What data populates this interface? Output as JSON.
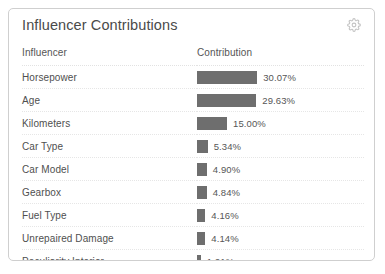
{
  "card": {
    "title": "Influencer Contributions",
    "gear_icon": "gear-icon"
  },
  "table": {
    "headers": {
      "influencer": "Influencer",
      "contribution": "Contribution"
    },
    "rows": [
      {
        "influencer": "Horsepower",
        "contribution_label": "30.07%",
        "contribution_value": 30.07
      },
      {
        "influencer": "Age",
        "contribution_label": "29.63%",
        "contribution_value": 29.63
      },
      {
        "influencer": "Kilometers",
        "contribution_label": "15.00%",
        "contribution_value": 15.0
      },
      {
        "influencer": "Car Type",
        "contribution_label": "5.34%",
        "contribution_value": 5.34
      },
      {
        "influencer": "Car Model",
        "contribution_label": "4.90%",
        "contribution_value": 4.9
      },
      {
        "influencer": "Gearbox",
        "contribution_label": "4.84%",
        "contribution_value": 4.84
      },
      {
        "influencer": "Fuel Type",
        "contribution_label": "4.16%",
        "contribution_value": 4.16
      },
      {
        "influencer": "Unrepaired Damage",
        "contribution_label": "4.14%",
        "contribution_value": 4.14
      },
      {
        "influencer": "Peculiarity Interior",
        "contribution_label": "1.91%",
        "contribution_value": 1.91
      }
    ]
  },
  "chart_data": {
    "type": "bar",
    "title": "Influencer Contributions",
    "xlabel": "Contribution",
    "ylabel": "Influencer",
    "categories": [
      "Horsepower",
      "Age",
      "Kilometers",
      "Car Type",
      "Car Model",
      "Gearbox",
      "Fuel Type",
      "Unrepaired Damage",
      "Peculiarity Interior"
    ],
    "values": [
      30.07,
      29.63,
      15.0,
      5.34,
      4.9,
      4.84,
      4.16,
      4.14,
      1.91
    ],
    "value_labels": [
      "30.07%",
      "29.63%",
      "15.00%",
      "5.34%",
      "4.90%",
      "4.84%",
      "4.16%",
      "4.14%",
      "1.91%"
    ],
    "xlim": [
      0,
      30.07
    ],
    "grid": false,
    "legend": false,
    "orientation": "horizontal",
    "bar_color": "#6e6e6e"
  },
  "style": {
    "bar_color": "#6e6e6e",
    "border_color": "#cfcfcf",
    "text_color": "#4f4f4f",
    "pixels_per_percent": 2.0
  }
}
